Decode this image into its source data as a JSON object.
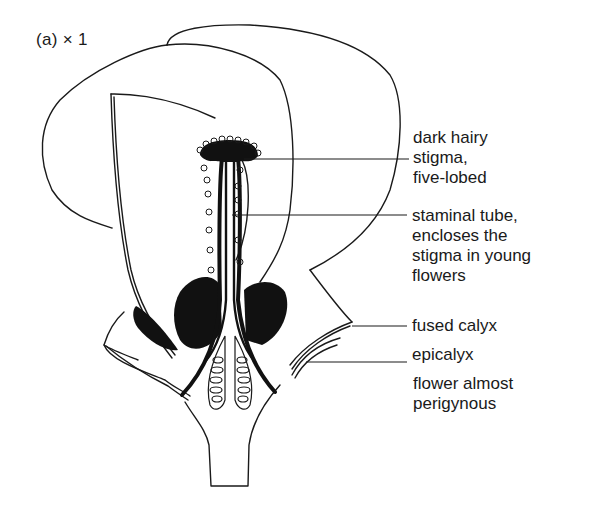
{
  "figure": {
    "caption": "(a)  × 1"
  },
  "labels": {
    "stigma": "dark hairy\nstigma,\nfive-lobed",
    "staminal_tube": "staminal tube,\nencloses the\nstigma in young\nflowers",
    "fused_calyx": "fused calyx",
    "epicalyx": "epicalyx",
    "perigyny_note": "flower almost\nperigynous"
  },
  "colors": {
    "ink": "#1a1a1a",
    "background": "#ffffff"
  }
}
